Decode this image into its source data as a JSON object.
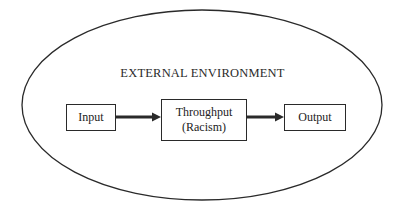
{
  "diagram": {
    "environment_label": "EXTERNAL ENVIRONMENT",
    "nodes": [
      {
        "id": "input",
        "label": "Input"
      },
      {
        "id": "throughput",
        "label": "Throughput",
        "sublabel": "(Racism)"
      },
      {
        "id": "output",
        "label": "Output"
      }
    ],
    "edges": [
      {
        "from": "input",
        "to": "throughput"
      },
      {
        "from": "throughput",
        "to": "output"
      }
    ]
  }
}
